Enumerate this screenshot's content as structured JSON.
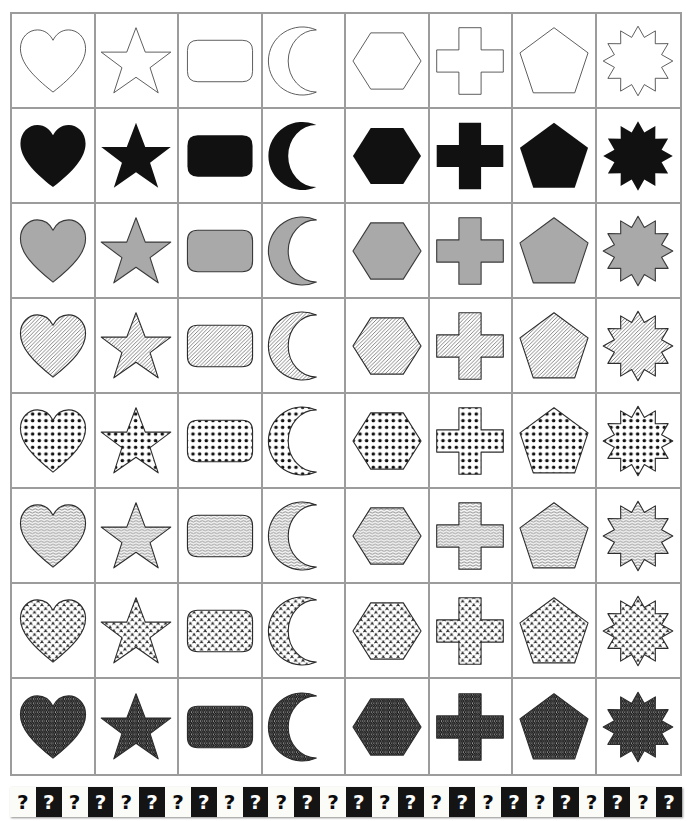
{
  "title": "",
  "colors": {
    "grid_line": "#9c9c9c",
    "outline": "#3a3a3a",
    "solid_black": "#111111",
    "solid_gray": "#a9a9a9",
    "page_background": "#ffffff",
    "qmark_dark_bg": "#141414",
    "qmark_light_bg": "#fbfbf8"
  },
  "grid": {
    "rows": 8,
    "columns": 8,
    "column_shapes": [
      "heart",
      "star",
      "rounded-rectangle",
      "crescent-moon",
      "hexagon",
      "cross",
      "pentagon",
      "twelve-point-burst"
    ],
    "row_fills": [
      "outline",
      "solid-black",
      "solid-gray",
      "diagonal-hatch",
      "polka-dots",
      "wavy-lines",
      "floral-clover",
      "herringbone-chevron"
    ]
  },
  "qmark_strip": {
    "symbol": "?",
    "count": 26,
    "pattern": "alternating-light-dark"
  }
}
